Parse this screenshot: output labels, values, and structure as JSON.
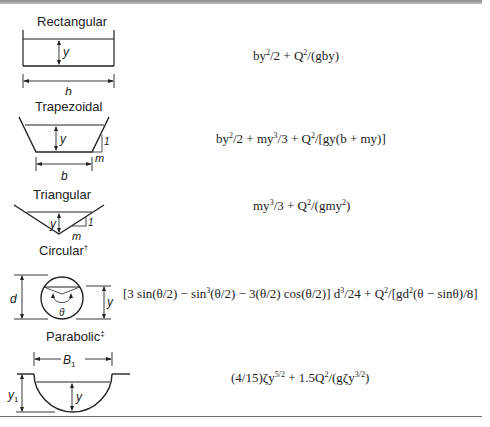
{
  "table": {
    "rows": [
      {
        "shape": "Rectangular",
        "footnote_mark": "",
        "diagram_labels": {
          "depth": "y",
          "width": "b"
        },
        "formula": {
          "parts": [
            "by",
            "2",
            "/2 + Q",
            "2",
            "/(gby)"
          ]
        }
      },
      {
        "shape": "Trapezoidal",
        "footnote_mark": "",
        "diagram_labels": {
          "depth": "y",
          "width": "b",
          "slope_rise": "1",
          "slope_run": "m"
        },
        "formula": {
          "parts": [
            "by",
            "2",
            "/2 + my",
            "3",
            "/3 + Q",
            "2",
            "/[gy(b + my)]"
          ]
        }
      },
      {
        "shape": "Triangular",
        "footnote_mark": "",
        "diagram_labels": {
          "depth": "y",
          "slope_rise": "1",
          "slope_run": "m"
        },
        "formula": {
          "parts": [
            "my",
            "3",
            "/3 + Q",
            "2",
            "/(gmy",
            "2",
            ")"
          ]
        }
      },
      {
        "shape": "Circular",
        "footnote_mark": "†",
        "diagram_labels": {
          "diameter": "d",
          "depth": "y",
          "angle": "θ"
        },
        "formula": {
          "parts": [
            "[3 sin(θ/2) − sin",
            "3",
            "(θ/2)  − 3(θ/2) cos(θ/2)] d",
            "3",
            "/24 + Q",
            "2",
            "/[gd",
            "2",
            "(θ − sinθ)/8]"
          ]
        }
      },
      {
        "shape": "Parabolic",
        "footnote_mark": "‡",
        "diagram_labels": {
          "top_width": "B",
          "top_width_sub": "1",
          "full_depth": "y",
          "full_depth_sub": "1",
          "depth": "y"
        },
        "formula": {
          "parts": [
            "(4/15)ζy",
            "5/2",
            " + 1.5Q",
            "2",
            "/(gζy",
            "3/2",
            ")"
          ]
        }
      }
    ]
  },
  "colors": {
    "ink": "#1a1a1a",
    "rule": "#8a8a8a"
  }
}
